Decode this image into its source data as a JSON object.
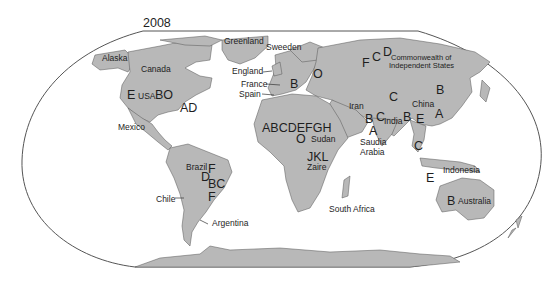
{
  "title": "2008",
  "colors": {
    "land": "#b8b8b8",
    "ocean": "#ffffff",
    "border": "#444444",
    "text": "#1e1e1e"
  },
  "labels": {
    "alaska": "Alaska",
    "canada": "Canada",
    "greenland": "Greenland",
    "sweeden": "Sweeden",
    "england": "England",
    "france": "France",
    "spain": "Spain",
    "usa": "USA",
    "usa_letter_left": "E",
    "usa_letters_right": "BO",
    "atlantic_letters": "AD",
    "mexico": "Mexico",
    "cis_line1": "Commonwealth of",
    "cis_line2": "Independent States",
    "cis_letters_f": "F",
    "cis_letters_c": "C",
    "cis_letters_d": "D",
    "europe_b": "B",
    "europe_o": "O",
    "iran": "Iran",
    "mideast_b": "B",
    "mideast_c": "C",
    "arabia_a": "A",
    "india": "India",
    "central_asia_c": "C",
    "china": "China",
    "china_b": "B",
    "china_a": "A",
    "seasia_b": "B",
    "seasia_e": "E",
    "seasia_c": "C",
    "indonesia": "Indonesia",
    "indonesia_e": "E",
    "saudia_line1": "Saudia",
    "saudia_line2": "Arabia",
    "africa_letters": "ABCDEFGH",
    "africa_o": "O",
    "sudan": "Sudan",
    "zaire_letters": "JKL",
    "zaire": "Zaire",
    "south_africa": "South Africa",
    "australia_b": "B",
    "australia": "Australia",
    "brazil": "Brazil",
    "brazil_f1": "F",
    "brazil_d": "D",
    "brazil_bc": "BC",
    "brazil_f2": "F",
    "chile": "Chile",
    "argentina": "Argentina"
  }
}
